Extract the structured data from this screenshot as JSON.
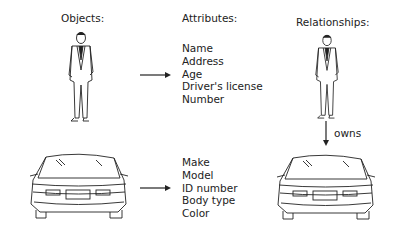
{
  "headers": {
    "objects": "Objects:",
    "attributes": "Attributes:",
    "relationships": "Relationships:"
  },
  "person_attributes": [
    "Name",
    "Address",
    "Age",
    "Driver's license",
    "Number"
  ],
  "car_attributes": [
    "Make",
    "Model",
    "ID number",
    "Body type",
    "Color"
  ],
  "relationship": {
    "label": "owns"
  },
  "icons": {
    "person": "man-in-suit-illustration",
    "car": "sports-car-front-illustration",
    "arrow": "arrow-right",
    "arrow_down": "arrow-down"
  },
  "colors": {
    "ink": "#222222",
    "background": "#ffffff"
  }
}
